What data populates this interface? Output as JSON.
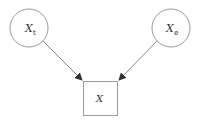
{
  "diagram": {
    "type": "directed-graph",
    "nodes": [
      {
        "id": "xt",
        "shape": "circle",
        "label": "X",
        "subscript": "t"
      },
      {
        "id": "xe",
        "shape": "circle",
        "label": "X",
        "subscript": "e"
      },
      {
        "id": "x",
        "shape": "square",
        "label": "X"
      }
    ],
    "edges": [
      {
        "from": "xt",
        "to": "x"
      },
      {
        "from": "xe",
        "to": "x"
      }
    ],
    "colors": {
      "stroke": "#8a8a8a",
      "text": "#333333",
      "background": "#ffffff"
    }
  }
}
